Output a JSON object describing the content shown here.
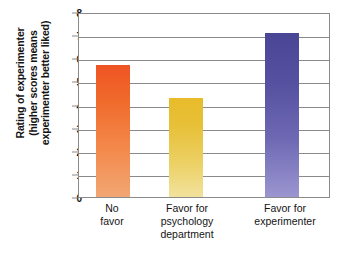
{
  "chart_data": {
    "type": "bar",
    "title": "",
    "xlabel": "",
    "ylabel": "Rating of experimenter (higher scores means experimenter better liked)",
    "ylabel_lines": [
      "Rating of experimenter",
      "(higher scores means",
      "experimenter better liked)"
    ],
    "categories": [
      "No favor",
      "Favor for psychology department",
      "Favor for experimenter"
    ],
    "category_lines": [
      [
        "No",
        "favor"
      ],
      [
        "Favor for",
        "psychology",
        "department"
      ],
      [
        "Favor for",
        "experimenter"
      ]
    ],
    "values": [
      5.75,
      4.35,
      7.15
    ],
    "ylim": [
      0,
      8
    ],
    "yticks": [
      0,
      1,
      2,
      3,
      4,
      5,
      6,
      7,
      8
    ],
    "ytick_labels": [
      "0",
      "1",
      "2",
      "3",
      "4",
      "5",
      "6",
      "7",
      "8"
    ],
    "grid": true,
    "legend": false,
    "bar_colors": [
      "#ef5423",
      "#e8bb2a",
      "#4a4696"
    ],
    "bar_colors_bottom": [
      "#f2a673",
      "#f2e29c",
      "#9b96d0"
    ],
    "axis_color": "#8a8a8a",
    "text_color": "#141414"
  }
}
